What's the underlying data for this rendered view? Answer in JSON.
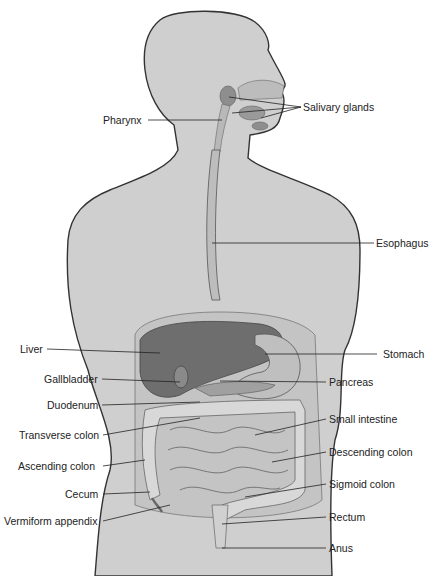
{
  "diagram": {
    "colors": {
      "body": "#cfcfcf",
      "outline": "#333333",
      "organ_dark": "#6e6e6e",
      "organ_mid": "#a8a8a8",
      "organ_light": "#dcdcdc",
      "text": "#222222"
    },
    "labels": [
      {
        "id": "salivary-glands",
        "text": "Salivary glands"
      },
      {
        "id": "pharynx",
        "text": "Pharynx"
      },
      {
        "id": "esophagus",
        "text": "Esophagus"
      },
      {
        "id": "liver",
        "text": "Liver"
      },
      {
        "id": "stomach",
        "text": "Stomach"
      },
      {
        "id": "gallbladder",
        "text": "Gallbladder"
      },
      {
        "id": "pancreas",
        "text": "Pancreas"
      },
      {
        "id": "duodenum",
        "text": "Duodenum"
      },
      {
        "id": "small-intestine",
        "text": "Small intestine"
      },
      {
        "id": "transverse-colon",
        "text": "Transverse colon"
      },
      {
        "id": "descending-colon",
        "text": "Descending colon"
      },
      {
        "id": "ascending-colon",
        "text": "Ascending colon"
      },
      {
        "id": "sigmoid-colon",
        "text": "Sigmoid colon"
      },
      {
        "id": "cecum",
        "text": "Cecum"
      },
      {
        "id": "rectum",
        "text": "Rectum"
      },
      {
        "id": "vermiform-appendix",
        "text": "Vermiform appendix"
      },
      {
        "id": "anus",
        "text": "Anus"
      }
    ]
  }
}
